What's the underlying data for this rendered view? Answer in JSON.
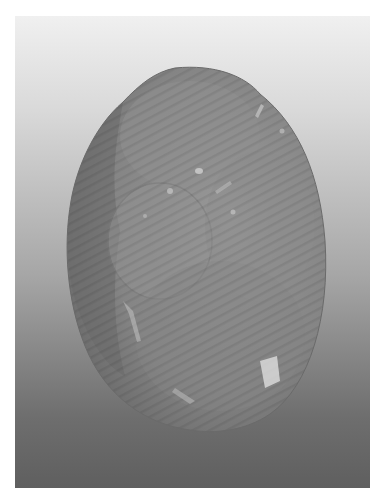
{
  "image": {
    "subject": "3D rendered shell specimen",
    "background": {
      "type": "vertical-gradient",
      "top_color": "#f0f0f0",
      "bottom_color": "#5f5f5f"
    },
    "object": {
      "base_color": "#8a8a8a",
      "shadow_color": "#5a5a5a",
      "highlight_color": "#d8d8d8",
      "texture": "diagonal striations"
    }
  }
}
